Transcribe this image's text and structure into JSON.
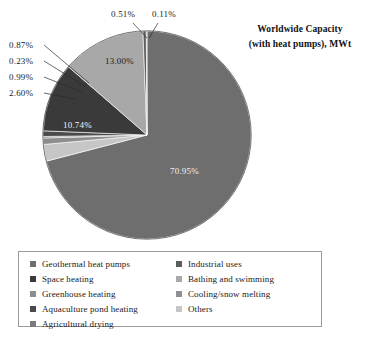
{
  "title": {
    "line1": "Worldwide Capacity",
    "line2": "(with heat pumps), MWt"
  },
  "labels": {
    "v7095": "70.95%",
    "v1300": "13.00%",
    "v1074": "10.74%",
    "v260": "2.60%",
    "v099": "0.99%",
    "v023": "0.23%",
    "v087": "0.87%",
    "v051": "0.51%",
    "v011": "0.11%"
  },
  "legend": {
    "left": [
      {
        "label": "Geothermal heat pumps",
        "color": "#6e6e6e"
      },
      {
        "label": "Space heating",
        "color": "#3a3a3a"
      },
      {
        "label": "Greenhouse heating",
        "color": "#8d8d8d"
      },
      {
        "label": "Aquaculture pond heating",
        "color": "#4a4a4a"
      },
      {
        "label": "Agricultural drying",
        "color": "#7a7a7a"
      }
    ],
    "right": [
      {
        "label": "Industrial uses",
        "color": "#5c5c5c"
      },
      {
        "label": "Bathing and swimming",
        "color": "#a8a8a8"
      },
      {
        "label": "Cooling/snow melting",
        "color": "#909090"
      },
      {
        "label": "Others",
        "color": "#c6c6c6"
      }
    ]
  },
  "chart_data": {
    "type": "pie",
    "title": "Worldwide Capacity (with heat pumps), MWt",
    "units": "percent",
    "start_angle_deg": 0,
    "direction": "clockwise",
    "legend_position": "bottom",
    "grid": false,
    "categories": [
      "Geothermal heat pumps",
      "Space heating",
      "Greenhouse heating",
      "Aquaculture pond heating",
      "Agricultural drying",
      "Industrial uses",
      "Bathing and swimming",
      "Cooling/snow melting",
      "Others"
    ],
    "values": [
      70.95,
      10.74,
      0.99,
      0.87,
      0.23,
      0.51,
      13.0,
      0.11,
      2.6
    ],
    "slices": [
      {
        "name": "Geothermal heat pumps",
        "value": 70.95,
        "label": "70.95%",
        "color": "#6e6e6e",
        "label_placement": "inside"
      },
      {
        "name": "Others",
        "value": 2.6,
        "label": "2.60%",
        "color": "#c6c6c6",
        "label_placement": "callout-left"
      },
      {
        "name": "Greenhouse heating",
        "value": 0.99,
        "label": "0.99%",
        "color": "#8d8d8d",
        "label_placement": "callout-left"
      },
      {
        "name": "Agricultural drying",
        "value": 0.23,
        "label": "0.23%",
        "color": "#7a7a7a",
        "label_placement": "callout-left"
      },
      {
        "name": "Aquaculture pond heating",
        "value": 0.87,
        "label": "0.87%",
        "color": "#4a4a4a",
        "label_placement": "callout-left"
      },
      {
        "name": "Space heating",
        "value": 10.74,
        "label": "10.74%",
        "color": "#3a3a3a",
        "label_placement": "inside"
      },
      {
        "name": "Bathing and swimming",
        "value": 13.0,
        "label": "13.00%",
        "color": "#a8a8a8",
        "label_placement": "inside"
      },
      {
        "name": "Industrial uses",
        "value": 0.51,
        "label": "0.51%",
        "color": "#5c5c5c",
        "label_placement": "callout-top"
      },
      {
        "name": "Cooling/snow melting",
        "value": 0.11,
        "label": "0.11%",
        "color": "#909090",
        "label_placement": "callout-top"
      }
    ]
  }
}
